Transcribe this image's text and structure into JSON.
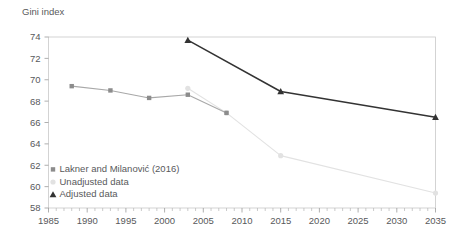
{
  "chart_data": {
    "type": "line",
    "title": "",
    "ylabel": "Gini index",
    "xlabel": "",
    "xlim": [
      1985,
      2035
    ],
    "ylim": [
      58,
      74
    ],
    "y_ticks": [
      58,
      60,
      62,
      64,
      66,
      68,
      70,
      72,
      74
    ],
    "x_ticks": [
      1985,
      1990,
      1995,
      2000,
      2005,
      2010,
      2015,
      2020,
      2025,
      2030,
      2035
    ],
    "x_minor_tick_step": 1,
    "grid": false,
    "legend_position": "bottom-left",
    "series": [
      {
        "name": "Lakner and Milanović (2016)",
        "marker": "square",
        "color": "#8c8c8c",
        "line_color": "#a8a8a8",
        "x": [
          1988,
          1993,
          1998,
          2003,
          2008
        ],
        "values": [
          69.4,
          69.0,
          68.3,
          68.6,
          66.9
        ]
      },
      {
        "name": "Unadjusted data",
        "marker": "circle",
        "color": "#e2e2e2",
        "line_color": "#e2e2e2",
        "x": [
          2003,
          2008,
          2015,
          2035
        ],
        "values": [
          69.2,
          66.9,
          62.9,
          59.4
        ]
      },
      {
        "name": "Adjusted data",
        "marker": "triangle",
        "color": "#333333",
        "line_color": "#333333",
        "x": [
          2003,
          2015,
          2035
        ],
        "values": [
          73.7,
          68.9,
          66.5
        ]
      }
    ]
  },
  "legend": {
    "items": [
      {
        "label": "Lakner and Milanović (2016)",
        "marker": "square",
        "color": "#8c8c8c"
      },
      {
        "label": "Unadjusted data",
        "marker": "circle",
        "color": "#e2e2e2"
      },
      {
        "label": "Adjusted data",
        "marker": "triangle",
        "color": "#333333"
      }
    ]
  },
  "axis": {
    "y_title": "Gini index"
  }
}
